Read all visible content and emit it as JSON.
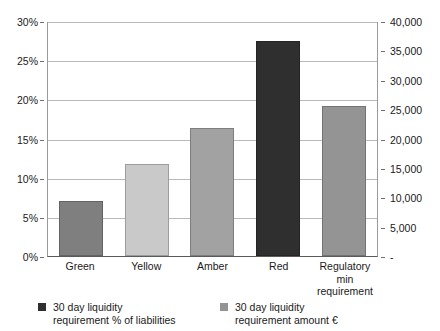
{
  "chart_data": {
    "type": "bar",
    "title": "",
    "xlabel": "",
    "ylabel": "",
    "categories": [
      "Green",
      "Yellow",
      "Amber",
      "Red",
      "Regulatory min requirement"
    ],
    "series": [
      {
        "name": "30 day liquidity requirement % of liabilities",
        "axis": "left",
        "values": [
          7.0,
          11.8,
          16.3,
          27.4,
          19.1
        ]
      }
    ],
    "bar_colors": [
      "#7f7f7f",
      "#c9c9c9",
      "#a2a2a2",
      "#2f2f2f",
      "#949494"
    ],
    "left_axis": {
      "label": "",
      "min": 0,
      "max": 30,
      "step": 5,
      "ticks": [
        "0%",
        "5%",
        "10%",
        "15%",
        "20%",
        "25%",
        "30%"
      ],
      "tick_values": [
        0,
        5,
        10,
        15,
        20,
        25,
        30
      ]
    },
    "right_axis": {
      "label": "",
      "min": 0,
      "max": 40000,
      "step": 5000,
      "ticks": [
        "-",
        "5,000",
        "10,000",
        "15,000",
        "20,000",
        "25,000",
        "30,000",
        "35,000",
        "40,000"
      ],
      "tick_values": [
        0,
        5000,
        10000,
        15000,
        20000,
        25000,
        30000,
        35000,
        40000
      ]
    },
    "grid": true,
    "legend_position": "bottom",
    "legend": [
      {
        "label": "30 day liquidity\nrequirement % of liabilities",
        "color": "#2f2f2f"
      },
      {
        "label": "30 day liquidity\nrequirement amount €",
        "color": "#949494"
      }
    ]
  }
}
